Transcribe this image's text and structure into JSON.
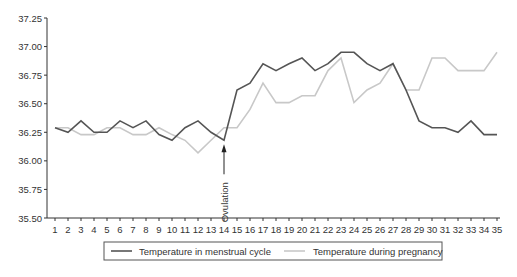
{
  "chart_data": {
    "type": "line",
    "title": "",
    "xlabel": "",
    "ylabel": "",
    "x": [
      1,
      2,
      3,
      4,
      5,
      6,
      7,
      8,
      9,
      10,
      11,
      12,
      13,
      14,
      15,
      16,
      17,
      18,
      19,
      20,
      21,
      22,
      23,
      24,
      25,
      26,
      27,
      28,
      29,
      30,
      31,
      32,
      33,
      34,
      35
    ],
    "ylim": [
      35.5,
      37.25
    ],
    "yticks": [
      "35.50",
      "35.75",
      "36.00",
      "36.25",
      "36.50",
      "36.75",
      "37.00",
      "37.25"
    ],
    "grid": false,
    "legend_position": "bottom",
    "series": [
      {
        "name": "Temperature in menstrual cycle",
        "color": "#555555",
        "values": [
          36.29,
          36.25,
          36.35,
          36.25,
          36.25,
          36.35,
          36.29,
          36.35,
          36.23,
          36.18,
          36.29,
          36.35,
          36.25,
          36.18,
          36.62,
          36.68,
          36.85,
          36.79,
          36.85,
          36.9,
          36.79,
          36.85,
          36.95,
          36.95,
          36.85,
          36.79,
          36.85,
          36.62,
          36.35,
          36.29,
          36.29,
          36.25,
          36.35,
          36.23,
          36.23
        ]
      },
      {
        "name": "Temperature during pregnancy",
        "color": "#c8c8c8",
        "values": [
          36.29,
          36.29,
          36.23,
          36.23,
          36.29,
          36.29,
          36.23,
          36.23,
          36.29,
          36.23,
          36.18,
          36.07,
          36.18,
          36.29,
          36.29,
          36.45,
          36.68,
          36.51,
          36.51,
          36.57,
          36.57,
          36.79,
          36.9,
          36.51,
          36.62,
          36.68,
          36.85,
          36.62,
          36.62,
          36.9,
          36.9,
          36.79,
          36.79,
          36.79,
          36.95
        ]
      }
    ],
    "annotations": [
      {
        "text": "Ovulation",
        "x": 14,
        "arrow": "up"
      }
    ]
  }
}
